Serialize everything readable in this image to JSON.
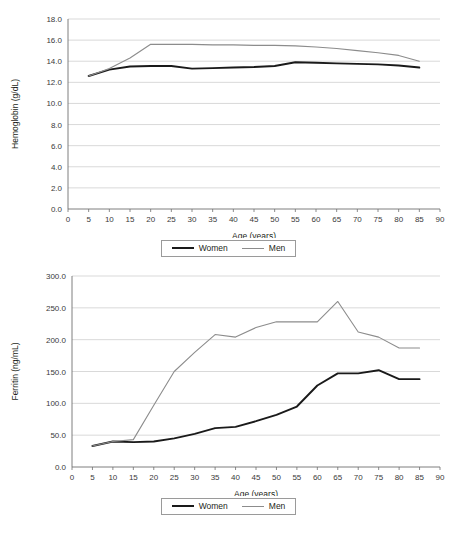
{
  "figure": {
    "background_color": "#ffffff",
    "series_colors": {
      "women": "#1a1a1a",
      "men": "#8c8c8c"
    },
    "grid_color": "#c9c9c9",
    "axis_color": "#6f6f6f"
  },
  "legend": {
    "women_label": "Women",
    "men_label": "Men"
  },
  "chart_data": [
    {
      "type": "line",
      "id": "hemoglobin",
      "title": "",
      "xlabel": "Age (years)",
      "ylabel": "Hemoglobin (g/dL)",
      "xlim": [
        0,
        90
      ],
      "ylim": [
        0,
        18
      ],
      "xticks": [
        0,
        5,
        10,
        15,
        20,
        25,
        30,
        35,
        40,
        45,
        50,
        55,
        60,
        65,
        70,
        75,
        80,
        85,
        90
      ],
      "xtick_labels": [
        "0",
        "5",
        "10",
        "15",
        "20",
        "25",
        "30",
        "35",
        "40",
        "45",
        "50",
        "55",
        "60",
        "65",
        "70",
        "75",
        "80",
        "85",
        "90"
      ],
      "yticks": [
        0,
        2,
        4,
        6,
        8,
        10,
        12,
        14,
        16,
        18
      ],
      "ytick_labels": [
        "0.0",
        "2.0",
        "4.0",
        "6.0",
        "8.0",
        "10.0",
        "12.0",
        "14.0",
        "16.0",
        "18.0"
      ],
      "grid": "horizontal",
      "legend_position": "below",
      "x": [
        5,
        10,
        15,
        20,
        25,
        30,
        35,
        40,
        45,
        50,
        55,
        60,
        65,
        70,
        75,
        80,
        85
      ],
      "series": [
        {
          "name": "Women",
          "color": "#1a1a1a",
          "values": [
            12.6,
            13.2,
            13.5,
            13.55,
            13.55,
            13.3,
            13.35,
            13.4,
            13.45,
            13.55,
            13.9,
            13.85,
            13.8,
            13.75,
            13.7,
            13.6,
            13.4
          ]
        },
        {
          "name": "Men",
          "color": "#8c8c8c",
          "values": [
            12.6,
            13.3,
            14.3,
            15.6,
            15.6,
            15.6,
            15.55,
            15.55,
            15.5,
            15.5,
            15.45,
            15.35,
            15.2,
            15.0,
            14.8,
            14.55,
            14.0
          ]
        }
      ]
    },
    {
      "type": "line",
      "id": "ferritin",
      "title": "",
      "xlabel": "Age (years)",
      "ylabel": "Ferritin (ng/mL)",
      "xlim": [
        0,
        90
      ],
      "ylim": [
        0,
        300
      ],
      "xticks": [
        0,
        5,
        10,
        15,
        20,
        25,
        30,
        35,
        40,
        45,
        50,
        55,
        60,
        65,
        70,
        75,
        80,
        85,
        90
      ],
      "xtick_labels": [
        "0",
        "5",
        "10",
        "15",
        "20",
        "25",
        "30",
        "35",
        "40",
        "45",
        "50",
        "55",
        "60",
        "65",
        "70",
        "75",
        "80",
        "85",
        "90"
      ],
      "yticks": [
        0,
        50,
        100,
        150,
        200,
        250,
        300
      ],
      "ytick_labels": [
        "0.0",
        "50.0",
        "100.0",
        "150.0",
        "200.0",
        "250.0",
        "300.0"
      ],
      "grid": "horizontal",
      "legend_position": "below",
      "x": [
        5,
        10,
        15,
        20,
        25,
        30,
        35,
        40,
        45,
        50,
        55,
        60,
        65,
        70,
        75,
        80,
        85
      ],
      "series": [
        {
          "name": "Women",
          "color": "#1a1a1a",
          "values": [
            33,
            40,
            39,
            40,
            45,
            52,
            61,
            63,
            72,
            82,
            95,
            128,
            147,
            147,
            152,
            138,
            138
          ]
        },
        {
          "name": "Men",
          "color": "#8c8c8c",
          "values": [
            33,
            40,
            43,
            97,
            150,
            180,
            208,
            204,
            219,
            228,
            228,
            228,
            260,
            212,
            204,
            187,
            187
          ]
        }
      ]
    }
  ]
}
